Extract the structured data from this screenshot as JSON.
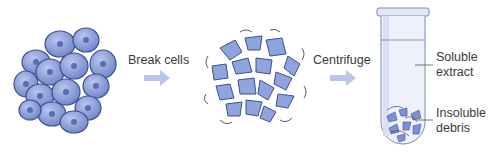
{
  "diagram": {
    "steps": [
      {
        "id": "intact-cells",
        "description": "Cluster of intact cells"
      },
      {
        "id": "arrow-1",
        "label": "Break cells"
      },
      {
        "id": "broken-cells",
        "description": "Broken cell fragments"
      },
      {
        "id": "arrow-2",
        "label": "Centrifuge"
      },
      {
        "id": "test-tube",
        "description": "Centrifuge tube with separated fractions"
      }
    ],
    "tube_labels": {
      "top": [
        "Soluble",
        "extract"
      ],
      "bottom": [
        "Insoluble",
        "debris"
      ]
    },
    "colors": {
      "cell_fill": "#8fa3dc",
      "cell_outline": "#3f4f8f",
      "arrow": "#b7c6ea",
      "tube_glass": "#e8ecf7",
      "tube_outline": "#7f8bb0",
      "text": "#3a3a3a"
    }
  }
}
